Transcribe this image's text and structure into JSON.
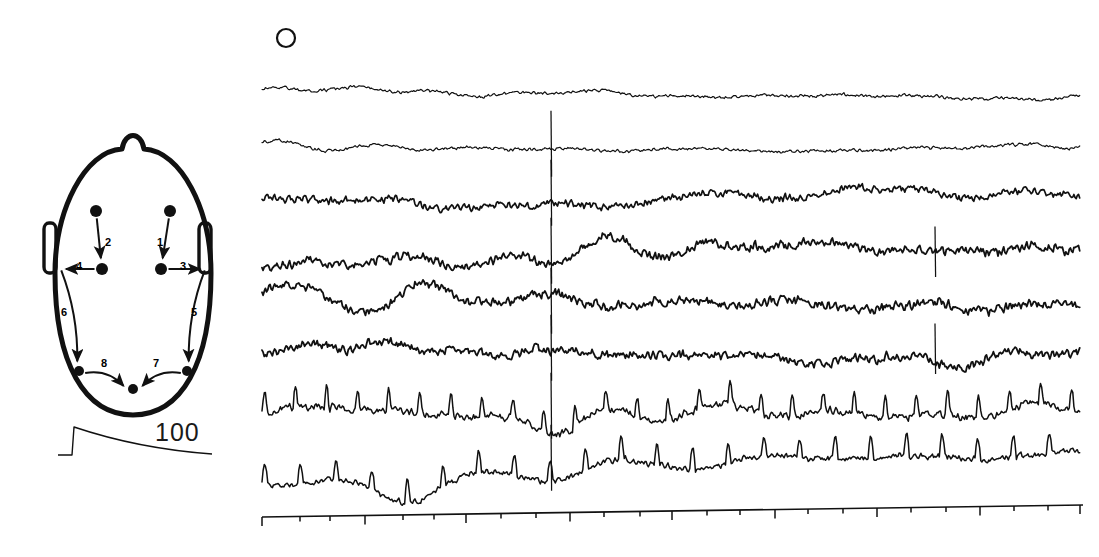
{
  "figure": {
    "panel_marker": {
      "symbol": "circle-outline",
      "name": "C",
      "x": 286,
      "y": 38,
      "r": 9
    },
    "ink_color": "#111111",
    "background_color": "#ffffff"
  },
  "head_diagram": {
    "name": "scalp-electrode-montage",
    "orientation": "top-down, nose at top",
    "outline": {
      "cx": 133,
      "cy": 280,
      "rx": 78,
      "ry": 135,
      "stroke_width": 5
    },
    "nose": {
      "x": 133,
      "y": 131,
      "width": 22,
      "height": 14
    },
    "ears": [
      {
        "side": "left",
        "x": 50,
        "y": 248,
        "w": 12,
        "h": 50
      },
      {
        "side": "right",
        "x": 205,
        "y": 248,
        "w": 12,
        "h": 50
      }
    ],
    "electrodes": [
      {
        "id": "rf",
        "label": "right-frontal",
        "x": 170,
        "y": 211,
        "r": 6
      },
      {
        "id": "lf",
        "label": "left-frontal",
        "x": 96,
        "y": 211,
        "r": 6
      },
      {
        "id": "rc",
        "label": "right-central",
        "x": 161,
        "y": 269,
        "r": 6
      },
      {
        "id": "lc",
        "label": "left-central",
        "x": 102,
        "y": 269,
        "r": 6
      },
      {
        "id": "rt",
        "label": "right-temporal",
        "x": 187,
        "y": 371,
        "r": 5
      },
      {
        "id": "lt",
        "label": "left-temporal",
        "x": 79,
        "y": 371,
        "r": 5
      },
      {
        "id": "oz",
        "label": "occipital",
        "x": 133,
        "y": 389,
        "r": 5
      },
      {
        "id": "rear",
        "label": "right-ear",
        "x": 205,
        "y": 269,
        "r": 0
      },
      {
        "id": "lear",
        "label": "left-ear",
        "x": 61,
        "y": 269,
        "r": 0
      }
    ],
    "derivations": [
      {
        "number": "1",
        "from": "rf",
        "to": "rc",
        "label_x": 157,
        "label_y": 237
      },
      {
        "number": "2",
        "from": "lf",
        "to": "lc",
        "label_x": 105,
        "label_y": 237
      },
      {
        "number": "3",
        "from": "rc",
        "to": "rear",
        "label_x": 180,
        "label_y": 261
      },
      {
        "number": "4",
        "from": "lc",
        "to": "lear",
        "label_x": 76,
        "label_y": 261
      },
      {
        "number": "5",
        "from": "rear",
        "to": "rt",
        "label_x": 191,
        "label_y": 307
      },
      {
        "number": "6",
        "from": "lear",
        "to": "lt",
        "label_x": 61,
        "label_y": 307
      },
      {
        "number": "7",
        "from": "rt",
        "to": "oz",
        "label_x": 153,
        "label_y": 358
      },
      {
        "number": "8",
        "from": "lt",
        "to": "oz",
        "label_x": 101,
        "label_y": 358
      }
    ]
  },
  "calibration": {
    "name": "amplitude-calibration",
    "value": "100",
    "unit_implied": "microvolts",
    "mark_x": 72,
    "mark_y": 455,
    "rise_height": 28,
    "decay_width": 140
  },
  "chart_data": {
    "type": "line",
    "title": "",
    "xlabel": "",
    "ylabel": "",
    "legend_position": "none",
    "grid": false,
    "plot_area": {
      "x0": 262,
      "x1": 1080,
      "y_top": 70,
      "y_bottom": 490
    },
    "time_axis": {
      "name": "time-axis",
      "x_start": 262,
      "y_start": 517,
      "x_end": 1083,
      "y_end": 505,
      "major_tick_length": 9,
      "minor_tick_length": 5,
      "ticks": [
        {
          "x": 262,
          "major": true
        },
        {
          "x": 300,
          "major": false
        },
        {
          "x": 330,
          "major": false
        },
        {
          "x": 365,
          "major": true
        },
        {
          "x": 403,
          "major": false
        },
        {
          "x": 434,
          "major": false
        },
        {
          "x": 466,
          "major": true
        },
        {
          "x": 501,
          "major": false
        },
        {
          "x": 536,
          "major": false
        },
        {
          "x": 570,
          "major": true
        },
        {
          "x": 604,
          "major": false
        },
        {
          "x": 640,
          "major": false
        },
        {
          "x": 672,
          "major": true
        },
        {
          "x": 707,
          "major": false
        },
        {
          "x": 740,
          "major": false
        },
        {
          "x": 775,
          "major": true
        },
        {
          "x": 808,
          "major": false
        },
        {
          "x": 843,
          "major": false
        },
        {
          "x": 877,
          "major": true
        },
        {
          "x": 911,
          "major": false
        },
        {
          "x": 946,
          "major": false
        },
        {
          "x": 980,
          "major": true
        },
        {
          "x": 1014,
          "major": false
        },
        {
          "x": 1048,
          "major": false
        },
        {
          "x": 1080,
          "major": true
        }
      ]
    },
    "channels": [
      {
        "index": 1,
        "derivation": "1",
        "baseline_y": 95,
        "amplitude": 7,
        "noise": 2,
        "freq": 1.0,
        "stroke": 1.2,
        "seed": 11
      },
      {
        "index": 2,
        "derivation": "2",
        "baseline_y": 148,
        "amplitude": 7,
        "noise": 2,
        "freq": 1.1,
        "stroke": 1.2,
        "seed": 23
      },
      {
        "index": 3,
        "derivation": "3",
        "baseline_y": 197,
        "amplitude": 16,
        "noise": 5,
        "freq": 0.85,
        "stroke": 1.7,
        "seed": 37
      },
      {
        "index": 4,
        "derivation": "4",
        "baseline_y": 255,
        "amplitude": 20,
        "noise": 6,
        "freq": 0.8,
        "stroke": 1.8,
        "seed": 51
      },
      {
        "index": 5,
        "derivation": "5",
        "baseline_y": 305,
        "amplitude": 14,
        "noise": 6,
        "freq": 0.95,
        "stroke": 1.8,
        "seed": 67
      },
      {
        "index": 6,
        "derivation": "6",
        "baseline_y": 352,
        "amplitude": 15,
        "noise": 6,
        "freq": 0.9,
        "stroke": 1.8,
        "seed": 83
      },
      {
        "index": 7,
        "derivation": "7",
        "baseline_y": 410,
        "amplitude": 22,
        "noise": 5,
        "freq": 0.7,
        "stroke": 1.5,
        "seed": 97
      },
      {
        "index": 8,
        "derivation": "8",
        "baseline_y": 462,
        "amplitude": 22,
        "noise": 4,
        "freq": 0.65,
        "stroke": 1.5,
        "seed": 113
      }
    ],
    "artifacts": [
      {
        "name": "artifact-spike-1",
        "x": 551,
        "channels": [
          2,
          3,
          4,
          5,
          6,
          7,
          8
        ],
        "height": 60
      },
      {
        "name": "artifact-spike-2",
        "x": 935,
        "channels": [
          4,
          6
        ],
        "height": 46
      }
    ]
  }
}
